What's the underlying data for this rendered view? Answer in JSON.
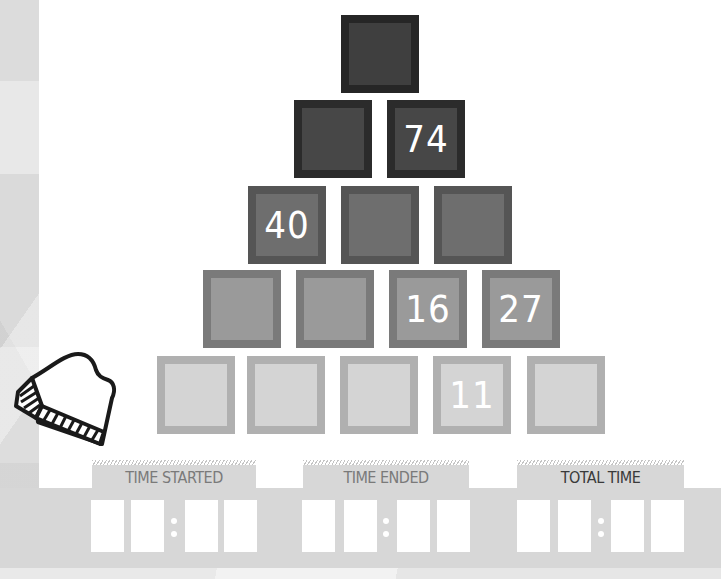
{
  "game": {
    "type": "number-pyramid",
    "colors": {
      "row1": "#3f3f3f",
      "row2": "#474747",
      "row3": "#6e6e6e",
      "row4": "#9a9a9a",
      "row5": "#d4d4d4",
      "panel": "#d7d7d7"
    }
  },
  "pyramid": {
    "rows": [
      [
        ""
      ],
      [
        "",
        "74"
      ],
      [
        "40",
        "",
        ""
      ],
      [
        "",
        "",
        "16",
        "27"
      ],
      [
        "",
        "",
        "",
        "11",
        ""
      ]
    ]
  },
  "timers": {
    "started": {
      "label": "TIME STARTED",
      "digits": [
        "",
        "",
        "",
        ""
      ]
    },
    "ended": {
      "label": "TIME ENDED",
      "digits": [
        "",
        "",
        "",
        ""
      ]
    },
    "total": {
      "label": "TOTAL TIME",
      "digits": [
        "",
        "",
        "",
        ""
      ]
    }
  },
  "decoration": {
    "icon": "mitten-icon"
  }
}
